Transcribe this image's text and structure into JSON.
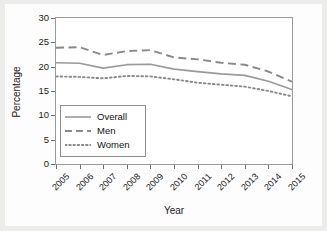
{
  "chart_data": {
    "type": "line",
    "title": "",
    "xlabel": "Year",
    "ylabel": "Percentage",
    "categories": [
      "2005",
      "2006",
      "2007",
      "2008",
      "2009",
      "2010",
      "2011",
      "2012",
      "2013",
      "2014",
      "2015"
    ],
    "x": [
      2005,
      2006,
      2007,
      2008,
      2009,
      2010,
      2011,
      2012,
      2013,
      2014,
      2015
    ],
    "xlim": [
      2005,
      2015
    ],
    "ylim": [
      0,
      30
    ],
    "yticks": [
      0,
      5,
      10,
      15,
      20,
      25,
      30
    ],
    "grid": false,
    "legend_position": "inside-lower-left",
    "series": [
      {
        "name": "Overall",
        "style": "solid",
        "color": "#9a9a9a",
        "values": [
          20.8,
          20.7,
          19.7,
          20.4,
          20.5,
          19.5,
          19.0,
          18.5,
          18.2,
          17.0,
          15.3
        ]
      },
      {
        "name": "Men",
        "style": "dashed",
        "color": "#8a8a8a",
        "values": [
          23.9,
          24.0,
          22.4,
          23.2,
          23.4,
          21.9,
          21.5,
          20.8,
          20.4,
          19.0,
          16.9
        ]
      },
      {
        "name": "Women",
        "style": "dotted",
        "color": "#8a8a8a",
        "values": [
          18.0,
          17.9,
          17.6,
          18.1,
          18.0,
          17.4,
          16.7,
          16.3,
          15.9,
          15.0,
          13.9
        ]
      }
    ]
  },
  "legend": {
    "items": [
      {
        "label": "Overall"
      },
      {
        "label": "Men"
      },
      {
        "label": "Women"
      }
    ]
  }
}
